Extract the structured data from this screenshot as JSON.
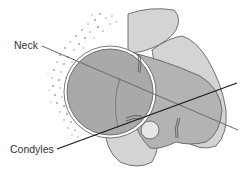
{
  "diagram": {
    "labels": [
      {
        "id": "neck",
        "text": "Neck"
      },
      {
        "id": "condyles",
        "text": "Condyles"
      }
    ],
    "colors": {
      "background": "#ffffff",
      "head_fill": "#a9a9a9",
      "bone_light": "#d4d4d4",
      "bone_mid": "#bdbdbd",
      "outline": "#555555",
      "stipple": "#9a9a9a",
      "neck_line": "#6a6a6a",
      "condyle_line": "#1a1a1a",
      "label_text": "#333333"
    },
    "lines": {
      "neck": {
        "x1": 42,
        "y1": 46,
        "x2": 238,
        "y2": 130
      },
      "condyles": {
        "x1": 57,
        "y1": 149,
        "x2": 237,
        "y2": 83
      }
    }
  }
}
